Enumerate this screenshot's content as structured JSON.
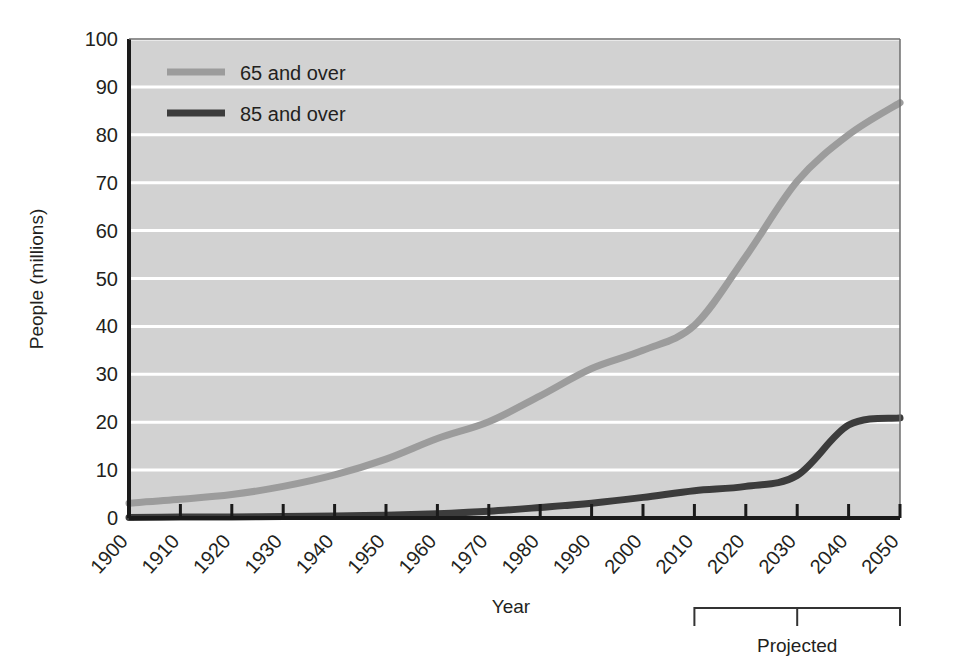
{
  "chart_data": {
    "type": "line",
    "title": "",
    "xlabel": "Year",
    "ylabel": "People (millions)",
    "xlim": [
      1900,
      2050
    ],
    "ylim": [
      0,
      100
    ],
    "yticks": [
      0,
      10,
      20,
      30,
      40,
      50,
      60,
      70,
      80,
      90,
      100
    ],
    "xticks": [
      1900,
      1910,
      1920,
      1930,
      1940,
      1950,
      1960,
      1970,
      1980,
      1990,
      2000,
      2010,
      2020,
      2030,
      2040,
      2050
    ],
    "grid": "horizontal",
    "legend_position": "top-left",
    "x": [
      1900,
      1910,
      1920,
      1930,
      1940,
      1950,
      1960,
      1970,
      1980,
      1990,
      2000,
      2010,
      2020,
      2030,
      2040,
      2050
    ],
    "series": [
      {
        "name": "65 and over",
        "color": "#9c9c9c",
        "values": [
          3.1,
          3.9,
          4.9,
          6.6,
          9.0,
          12.3,
          16.6,
          20.1,
          25.5,
          31.2,
          35.0,
          40.2,
          54.6,
          70.3,
          80.0,
          86.7
        ]
      },
      {
        "name": "85 and over",
        "color": "#3c3c3c",
        "values": [
          0.1,
          0.2,
          0.2,
          0.3,
          0.4,
          0.6,
          0.9,
          1.4,
          2.2,
          3.1,
          4.3,
          5.7,
          6.6,
          8.9,
          19.4,
          20.9
        ]
      }
    ],
    "annotations": [
      {
        "label": "Projected",
        "type": "bracket",
        "x_start": 2010,
        "x_end": 2050,
        "x_tick": 2030
      }
    ]
  },
  "legend": {
    "items": [
      {
        "label": "65 and over"
      },
      {
        "label": "85 and over"
      }
    ]
  },
  "axes": {
    "y_title": "People (millions)",
    "x_title": "Year",
    "y_ticks": [
      "0",
      "10",
      "20",
      "30",
      "40",
      "50",
      "60",
      "70",
      "80",
      "90",
      "100"
    ],
    "x_ticks": [
      "1900",
      "1910",
      "1920",
      "1930",
      "1940",
      "1950",
      "1960",
      "1970",
      "1980",
      "1990",
      "2000",
      "2010",
      "2020",
      "2030",
      "2040",
      "2050"
    ]
  },
  "annotation": {
    "projected_label": "Projected"
  },
  "colors": {
    "plot_background": "#d2d2d2",
    "gridline": "#ffffff",
    "axis": "#1a1a1a",
    "series_65": "#9c9c9c",
    "series_85": "#3c3c3c",
    "text": "#231f20"
  }
}
